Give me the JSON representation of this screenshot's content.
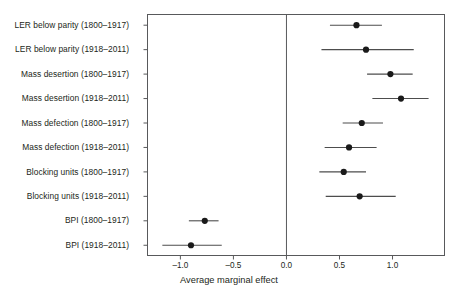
{
  "chart_data": {
    "type": "scatter",
    "subtype": "forest-plot",
    "title": "",
    "xlabel": "Average marginal effect",
    "ylabel": "",
    "xlim": [
      -1.31,
      1.49
    ],
    "xticks": [
      -1.0,
      -0.5,
      0.0,
      0.5,
      1.0
    ],
    "xtick_labels": [
      "–1.0",
      "–0.5",
      "0.0",
      "0.5",
      "1.0"
    ],
    "grid": false,
    "legend": null,
    "reference_line": 0.0,
    "categories": [
      "LER below parity (1800–1917)",
      "LER below parity (1918–2011)",
      "Mass desertion (1800–1917)",
      "Mass desertion (1918–2011)",
      "Mass defection (1800–1917)",
      "Mass defection (1918–2011)",
      "Blocking units (1800–1917)",
      "Blocking units (1918–2011)",
      "BPI (1800–1917)",
      "BPI (1918–2011)"
    ],
    "points": [
      {
        "label": "LER below parity (1800–1917)",
        "estimate": 0.66,
        "ci_low": 0.41,
        "ci_high": 0.9
      },
      {
        "label": "LER below parity (1918–2011)",
        "estimate": 0.75,
        "ci_low": 0.33,
        "ci_high": 1.2
      },
      {
        "label": "Mass desertion (1800–1917)",
        "estimate": 0.98,
        "ci_low": 0.76,
        "ci_high": 1.19
      },
      {
        "label": "Mass desertion (1918–2011)",
        "estimate": 1.08,
        "ci_low": 0.81,
        "ci_high": 1.34
      },
      {
        "label": "Mass defection (1800–1917)",
        "estimate": 0.71,
        "ci_low": 0.53,
        "ci_high": 0.91
      },
      {
        "label": "Mass defection (1918–2011)",
        "estimate": 0.59,
        "ci_low": 0.36,
        "ci_high": 0.85
      },
      {
        "label": "Blocking units (1800–1917)",
        "estimate": 0.54,
        "ci_low": 0.31,
        "ci_high": 0.75
      },
      {
        "label": "Blocking units (1918–2011)",
        "estimate": 0.69,
        "ci_low": 0.37,
        "ci_high": 1.03
      },
      {
        "label": "BPI (1800–1917)",
        "estimate": -0.77,
        "ci_low": -0.92,
        "ci_high": -0.64
      },
      {
        "label": "BPI (1918–2011)",
        "estimate": -0.9,
        "ci_low": -1.17,
        "ci_high": -0.61
      }
    ],
    "colors": {
      "marker": "#1a1a1a",
      "ci_line": "#4d4d4d",
      "frame": "#58595b",
      "reference_line": "#58595b",
      "text": "#231f20",
      "background": "#ffffff"
    }
  }
}
